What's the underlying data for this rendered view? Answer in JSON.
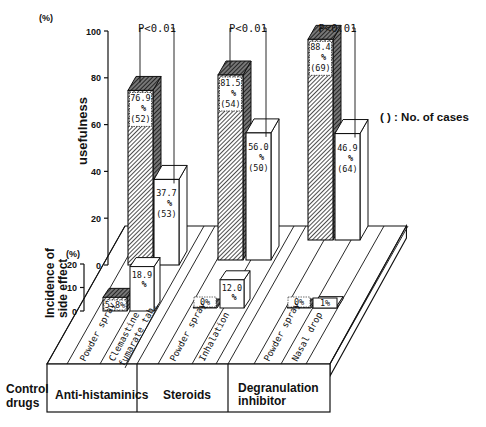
{
  "chart_data": {
    "type": "bar",
    "title": "",
    "subtitle": "3D grouped bar chart: usefulness and incidence of side effect by drug category",
    "legend_note": "( ) : No. of cases",
    "ylabel": "usefulness",
    "ylabel_unit": "(%)",
    "ylim": [
      0,
      100
    ],
    "yticks": [
      0,
      20,
      40,
      60,
      80,
      100
    ],
    "secondary_ylabel": "Incidence of side effect",
    "secondary_ylabel_unit": "(%)",
    "secondary_ylim": [
      0,
      20
    ],
    "secondary_yticks": [
      0,
      10,
      20
    ],
    "row_label": "Control drugs",
    "groups": [
      {
        "category": "Anti-histaminics",
        "significance": "P<0.01",
        "bars": [
          {
            "label": "Powder spray",
            "pattern": "hatched",
            "usefulness": 76.9,
            "usefulness_label": "76.9 %",
            "cases": 52,
            "side_effect": 5.8,
            "side_effect_label": "5.8%"
          },
          {
            "label": "Clemastine fumarate tab.",
            "pattern": "white",
            "usefulness": 37.7,
            "usefulness_label": "37.7 %",
            "cases": 53,
            "side_effect": 18.9,
            "side_effect_label": "18.9 %"
          }
        ]
      },
      {
        "category": "Steroids",
        "significance": "P<0.01",
        "bars": [
          {
            "label": "Powder spray",
            "pattern": "hatched",
            "usefulness": 81.5,
            "usefulness_label": "81.5 %",
            "cases": 54,
            "side_effect": 0,
            "side_effect_label": "0%"
          },
          {
            "label": "Inhalation",
            "pattern": "white",
            "usefulness": 56.0,
            "usefulness_label": "56.0 %",
            "cases": 50,
            "side_effect": 12.0,
            "side_effect_label": "12.0 %"
          }
        ]
      },
      {
        "category": "Degranulation inhibitor",
        "significance": "P<0.01",
        "bars": [
          {
            "label": "Powder spray",
            "pattern": "hatched",
            "usefulness": 88.4,
            "usefulness_label": "88.4 %",
            "cases": 69,
            "side_effect": 0,
            "side_effect_label": "0%"
          },
          {
            "label": "Nasal drop",
            "pattern": "white",
            "usefulness": 46.9,
            "usefulness_label": "46.9 %",
            "cases": 64,
            "side_effect": 1,
            "side_effect_label": "1%"
          }
        ]
      }
    ]
  },
  "labels": {
    "y_unit": "(%)",
    "y_axis_title": "usefulness",
    "side_unit": "(%)",
    "side_axis_title_line1": "Incidence of",
    "side_axis_title_line2": "side effect",
    "legend": "( ) : No. of cases",
    "control_line1": "Control",
    "control_line2": "drugs",
    "cat1": "Anti-histaminics",
    "cat2": "Steroids",
    "cat3_line1": "Degranulation",
    "cat3_line2": "inhibitor"
  },
  "colors": {
    "ink": "#111111",
    "paper": "#ffffff",
    "hatch": "#222222"
  }
}
